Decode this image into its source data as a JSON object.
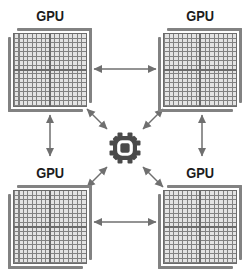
{
  "colors": {
    "background": "#ffffff",
    "label_text": "#1c1c1c",
    "chip_gray": "#828282",
    "chip_line_dark": "#6b6b6b",
    "chip_cell": "#e4e4e4",
    "arrow_gray": "#6f6f6f",
    "hub_gear": "#4a4a4a",
    "ring_white": "#ffffff"
  },
  "diagram": {
    "gpus": [
      {
        "position": "top-left",
        "label": "GPU",
        "icon": "gpu-die-icon"
      },
      {
        "position": "top-right",
        "label": "GPU",
        "icon": "gpu-die-icon"
      },
      {
        "position": "bottom-left",
        "label": "GPU",
        "icon": "gpu-die-icon"
      },
      {
        "position": "bottom-right",
        "label": "GPU",
        "icon": "gpu-die-icon"
      }
    ],
    "hub": {
      "icon": "gear-chip-icon"
    },
    "connections": [
      {
        "from": "gpu-top-left",
        "to": "gpu-top-right",
        "style": "double-arrow"
      },
      {
        "from": "gpu-bottom-left",
        "to": "gpu-bottom-right",
        "style": "double-arrow"
      },
      {
        "from": "gpu-top-left",
        "to": "gpu-bottom-left",
        "style": "double-arrow"
      },
      {
        "from": "gpu-top-right",
        "to": "gpu-bottom-right",
        "style": "double-arrow"
      },
      {
        "from": "gpu-top-left",
        "to": "hub",
        "style": "double-arrow"
      },
      {
        "from": "gpu-top-right",
        "to": "hub",
        "style": "double-arrow"
      },
      {
        "from": "gpu-bottom-left",
        "to": "hub",
        "style": "double-arrow"
      },
      {
        "from": "gpu-bottom-right",
        "to": "hub",
        "style": "double-arrow"
      }
    ]
  }
}
